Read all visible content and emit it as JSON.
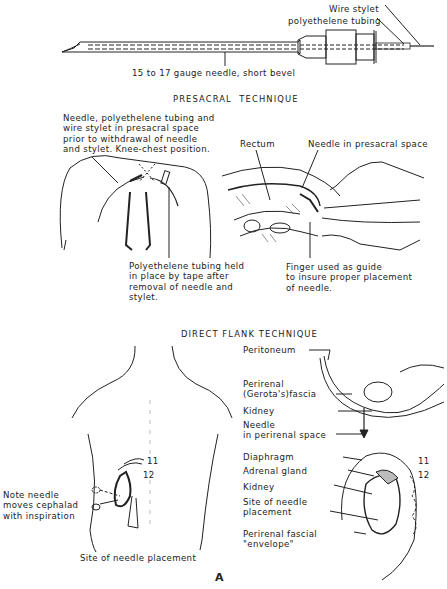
{
  "figure": {
    "letter": "A",
    "needle_diagram": {
      "labels": {
        "wire_stylet": "Wire stylet",
        "polyethylene_tubing": "polyethelene tubing",
        "needle": "15 to 17 gauge needle, short bevel"
      }
    },
    "presacral": {
      "title": "PRESACRAL  TECHNIQUE",
      "left_caption": "Needle, polyethelene tubing and\nwire stylet in presacral space\nprior to withdrawal of needle\nand stylet. Knee-chest position.",
      "tubing_caption": "Polyethelene tubing held\nin place by tape after\nremoval of needle and\nstylet.",
      "rectum_label": "Rectum",
      "needle_label": "Needle in presacral space",
      "finger_caption": "Finger used as guide\nto insure proper placement\nof needle."
    },
    "direct_flank": {
      "title": "DIRECT FLANK TECHNIQUE",
      "cross_section_labels": [
        "Peritoneum",
        "Perirenal\n(Gerota's)fascia",
        "Kidney",
        "Needle\nin perirenal space"
      ],
      "kidney_detail_labels": [
        "Diaphragm",
        "Adrenal gland",
        "Kidney",
        "Site of needle\nplacement",
        "Perirenal fascial\n\"envelope\""
      ],
      "rib_labels": [
        "11",
        "12"
      ],
      "back_rib_labels": [
        "11",
        "12"
      ],
      "inspiration_note": "Note needle\nmoves cephalad\nwith inspiration",
      "site_caption": "Site of needle placement"
    }
  }
}
